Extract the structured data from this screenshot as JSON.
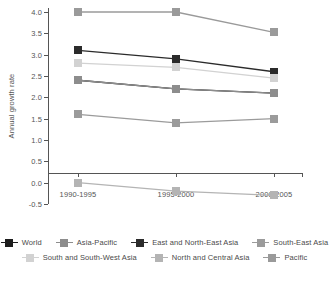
{
  "chart_data": {
    "type": "line",
    "title": "",
    "xlabel": "",
    "ylabel": "Annual growth rate",
    "categories": [
      "1990-1995",
      "1995-2000",
      "2000-2005"
    ],
    "ylim": [
      -0.5,
      4.0
    ],
    "ytick_labels": [
      "4.0",
      "3.5",
      "3.0",
      "2.5",
      "2.0",
      "1.5",
      "1.0",
      "0.5",
      "0.0",
      "-0.5"
    ],
    "ytick_values": [
      4.0,
      3.5,
      3.0,
      2.5,
      2.0,
      1.5,
      1.0,
      0.5,
      0.0,
      -0.5
    ],
    "grid": false,
    "legend_position": "bottom",
    "series": [
      {
        "name": "World",
        "values": [
          2.4,
          2.2,
          2.1
        ],
        "color": "#1c1c1c"
      },
      {
        "name": "Asia-Pacific",
        "values": [
          2.4,
          2.2,
          2.1
        ],
        "color": "#8d8d8d"
      },
      {
        "name": "East and North-East Asia",
        "values": [
          3.1,
          2.9,
          2.6
        ],
        "color": "#2b2b2b"
      },
      {
        "name": "South-East Asia",
        "values": [
          1.6,
          1.4,
          1.5
        ],
        "color": "#9b9b9b"
      },
      {
        "name": "South and South-West Asia",
        "values": [
          2.8,
          2.7,
          2.45
        ],
        "color": "#d2d2d2"
      },
      {
        "name": "North and Central Asia",
        "values": [
          0.0,
          -0.2,
          -0.3
        ],
        "color": "#b4b4b4"
      },
      {
        "name": "Pacific",
        "values": [
          4.0,
          4.0,
          3.52
        ],
        "color": "#9a9a9a"
      }
    ]
  },
  "legend": {
    "rows": [
      [
        "World",
        "Asia-Pacific",
        "East and North-East Asia",
        "South-East Asia"
      ],
      [
        "South and South-West Asia",
        "North and Central Asia",
        "Pacific"
      ]
    ]
  }
}
